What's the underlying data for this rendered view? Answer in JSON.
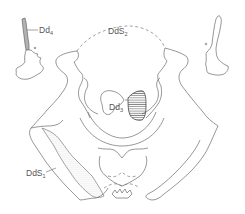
{
  "figure": {
    "type": "inkblot-location-diagram",
    "labels": [
      {
        "id": "dd4",
        "base": "Dd",
        "sub": "4"
      },
      {
        "id": "dds2",
        "base": "DdS",
        "sub": "2"
      },
      {
        "id": "dd3",
        "base": "Dd",
        "sub": "3"
      },
      {
        "id": "dds1",
        "base": "DdS",
        "sub": "1"
      }
    ],
    "colors": {
      "line": "#6a6a6a",
      "text": "#555555",
      "background": "#ffffff"
    },
    "fills": {
      "dd4": "striped-vertical",
      "dd3": "horizontal-hatch",
      "dds1": "dotted-stipple",
      "dds2": "dashed-outline"
    }
  }
}
